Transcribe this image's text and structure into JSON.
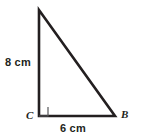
{
  "figure": {
    "type": "right-triangle-diagram",
    "background_color": "#ffffff",
    "stroke_color": "#231f20",
    "stroke_width": 2.6,
    "right_angle_marker": {
      "present": true,
      "at_vertex": "C",
      "size": 9,
      "stroke_color": "#58595b",
      "stroke_width": 1.2
    },
    "vertices": {
      "apex": {
        "label": "",
        "x": 39,
        "y": 10
      },
      "c": {
        "label": "C",
        "x": 39,
        "y": 116
      },
      "b": {
        "label": "B",
        "x": 115,
        "y": 116
      }
    },
    "labels": {
      "vertical_leg": "8 cm",
      "horizontal_leg": "6 cm",
      "vertex_c": "C",
      "vertex_b": "B"
    },
    "measurements": {
      "vertical_leg_value": 8,
      "horizontal_leg_value": 6,
      "unit": "cm"
    }
  }
}
